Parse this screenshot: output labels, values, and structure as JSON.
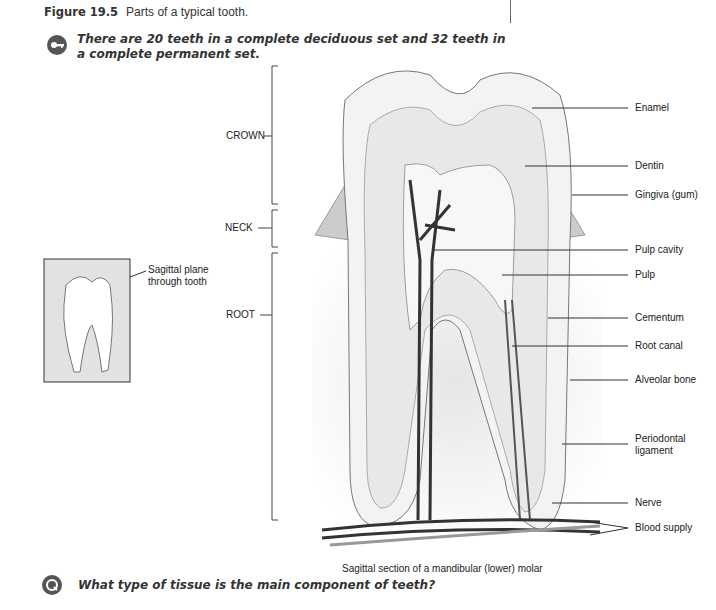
{
  "figure": {
    "number": "Figure 19.5",
    "title": "Parts of a typical tooth."
  },
  "key_fact": {
    "icon": "key-icon",
    "text": "There are 20 teeth in a complete deciduous set and 32 teeth in a complete permanent set."
  },
  "segments": [
    {
      "label": "CROWN"
    },
    {
      "label": "NECK"
    },
    {
      "label": "ROOT"
    }
  ],
  "inset": {
    "label_line1": "Sagittal plane",
    "label_line2": "through tooth"
  },
  "labels": [
    {
      "text": "Enamel"
    },
    {
      "text": "Dentin"
    },
    {
      "text": "Gingiva (gum)"
    },
    {
      "text": "Pulp cavity"
    },
    {
      "text": "Pulp"
    },
    {
      "text": "Cementum"
    },
    {
      "text": "Root canal"
    },
    {
      "text": "Alveolar bone"
    },
    {
      "text": "Periodontal"
    },
    {
      "text": "ligament"
    },
    {
      "text": "Nerve"
    },
    {
      "text": "Blood supply"
    }
  ],
  "caption": "Sagittal section of a mandibular (lower) molar",
  "question": {
    "icon": "question-icon",
    "text": "What type of tissue is the main component of teeth?"
  }
}
